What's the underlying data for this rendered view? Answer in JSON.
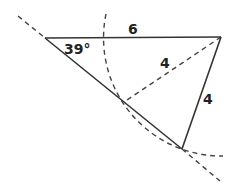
{
  "diagram": {
    "type": "triangle-construction",
    "colors": {
      "stroke": "#333333",
      "dashed": "#444444",
      "text": "#222222",
      "background": "#ffffff"
    },
    "vertices": {
      "A": {
        "x": 45,
        "y": 38
      },
      "B": {
        "x": 221,
        "y": 37
      },
      "C": {
        "x": 182,
        "y": 149
      },
      "D": {
        "x": 124,
        "y": 102
      }
    },
    "labels": {
      "angle": "39°",
      "top_side": "6",
      "dashed_side": "4",
      "right_side": "4"
    }
  }
}
